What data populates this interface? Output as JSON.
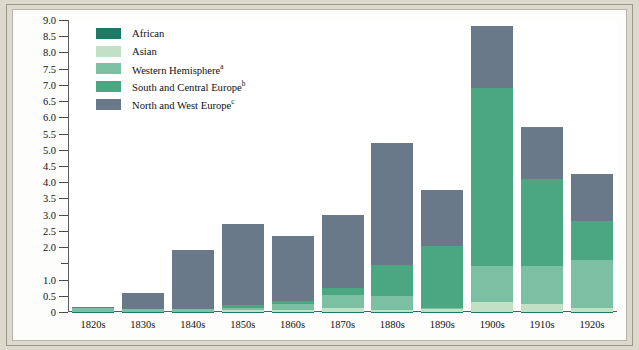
{
  "chart_data": {
    "type": "bar",
    "subtype": "stacked-vertical",
    "title": "",
    "xlabel": "",
    "ylabel": "Number of Immigrants per Decade (in millions)",
    "ylim": [
      0,
      9.0
    ],
    "ytick_step": 0.5,
    "yticks": [
      "0",
      "0.5",
      "1.0",
      "1.5",
      "2.0",
      "2.5",
      "3.0",
      "3.5",
      "4.0",
      "4.5",
      "5.0",
      "5.5",
      "6.0",
      "6.5",
      "7.0",
      "7.5",
      "8.0",
      "8.5",
      "9.0"
    ],
    "ytick_labels_shown": [
      "0",
      "0.5",
      "1.0",
      "2.0",
      "2.5",
      "3.0",
      "3.5",
      "4.0",
      "4.5",
      "5.0",
      "5.5",
      "6.0",
      "6.5",
      "7.0",
      "7.5",
      "8.0",
      "8.5",
      "9.0"
    ],
    "grid": false,
    "legend_position": "top-left",
    "categories": [
      "1820s",
      "1830s",
      "1840s",
      "1850s",
      "1860s",
      "1870s",
      "1880s",
      "1890s",
      "1900s",
      "1910s",
      "1920s"
    ],
    "series": [
      {
        "name": "African",
        "color": "#1d7a66",
        "values": [
          0.01,
          0.01,
          0.01,
          0.01,
          0.01,
          0.01,
          0.01,
          0.01,
          0.01,
          0.01,
          0.01
        ]
      },
      {
        "name": "Asian",
        "color": "#c2e0c6",
        "values": [
          0.0,
          0.0,
          0.0,
          0.04,
          0.06,
          0.12,
          0.06,
          0.07,
          0.3,
          0.25,
          0.1
        ]
      },
      {
        "name": "Western Hemisphere",
        "color": "#7cc0a4",
        "values": [
          0.1,
          0.07,
          0.07,
          0.08,
          0.17,
          0.4,
          0.43,
          0.04,
          1.1,
          1.15,
          1.5
        ]
      },
      {
        "name": "South and Central Europe",
        "color": "#4aa782",
        "values": [
          0.01,
          0.02,
          0.02,
          0.1,
          0.1,
          0.21,
          0.96,
          1.92,
          5.5,
          2.7,
          1.2
        ]
      },
      {
        "name": "North and West Europe",
        "color": "#69798a",
        "values": [
          0.04,
          0.5,
          1.8,
          2.47,
          2.0,
          2.26,
          3.74,
          1.71,
          1.9,
          1.6,
          1.45
        ]
      }
    ],
    "totals": [
      0.16,
      0.6,
      1.9,
      2.7,
      2.34,
      3.0,
      5.2,
      3.75,
      8.81,
      5.71,
      4.26
    ],
    "legend": [
      {
        "label": "African",
        "superscript": "",
        "color": "#1d7a66"
      },
      {
        "label": "Asian",
        "superscript": "",
        "color": "#c2e0c6"
      },
      {
        "label": "Western Hemisphere",
        "superscript": "a",
        "color": "#7cc0a4"
      },
      {
        "label": "South and Central Europe",
        "superscript": "b",
        "color": "#4aa782"
      },
      {
        "label": "North and West Europe",
        "superscript": "c",
        "color": "#69798a"
      }
    ],
    "axis_color": "#5b5b5b",
    "background_color": "#ded9cd",
    "plot_background_color": "#ffffff"
  }
}
